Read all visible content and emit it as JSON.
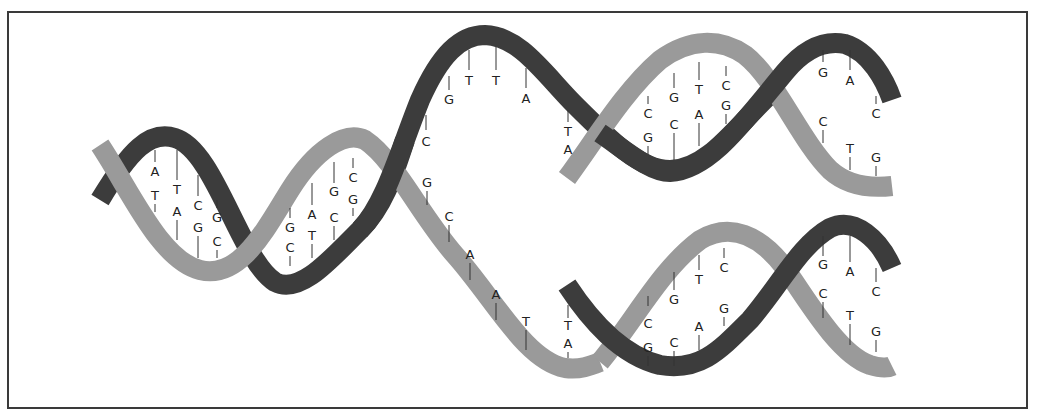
{
  "diagram": {
    "colors": {
      "dark_strand": "#3c3c3c",
      "light_strand": "#9a9a9a",
      "frame": "#3a3a3a",
      "text": "#222222"
    },
    "parental_helix": {
      "base_pairs": [
        {
          "top": "A",
          "bottom": "T"
        },
        {
          "top": "T",
          "bottom": "A"
        },
        {
          "top": "C",
          "bottom": "G"
        },
        {
          "top": "G",
          "bottom": "C"
        },
        {
          "top": "G",
          "bottom": "C"
        },
        {
          "top": "A",
          "bottom": "T"
        },
        {
          "top": "G",
          "bottom": "C"
        },
        {
          "top": "C",
          "bottom": "G"
        }
      ]
    },
    "unwound_dark_strand_bases": [
      "C",
      "G",
      "T",
      "T",
      "A",
      "T"
    ],
    "unwound_light_strand_bases": [
      "G",
      "C",
      "A",
      "A",
      "T",
      "A"
    ],
    "daughter_helix_top": {
      "fork_pair": {
        "top": "T",
        "bottom": "A"
      },
      "base_pairs": [
        {
          "top": "C",
          "bottom": "G"
        },
        {
          "top": "G",
          "bottom": "C"
        },
        {
          "top": "T",
          "bottom": "A"
        },
        {
          "top": "C",
          "bottom": "G"
        },
        {
          "top": "G",
          "bottom": "C"
        },
        {
          "top": "A",
          "bottom": "T"
        },
        {
          "top": "C",
          "bottom": "G"
        }
      ]
    },
    "daughter_helix_bottom": {
      "fork_pair": {
        "top": "T",
        "bottom": "A"
      },
      "base_pairs": [
        {
          "top": "C",
          "bottom": "G"
        },
        {
          "top": "G",
          "bottom": "C"
        },
        {
          "top": "T",
          "bottom": "A"
        },
        {
          "top": "C",
          "bottom": "G"
        },
        {
          "top": "G",
          "bottom": "C"
        },
        {
          "top": "A",
          "bottom": "T"
        },
        {
          "top": "C",
          "bottom": "G"
        }
      ]
    }
  }
}
